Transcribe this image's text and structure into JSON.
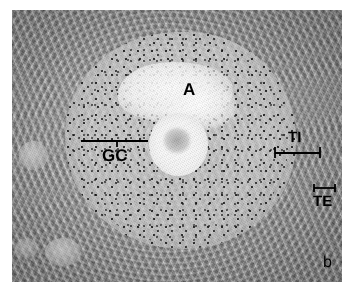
{
  "figure": {
    "panel_label": "b",
    "type": "histology-micrograph",
    "modality": "brightfield light microscopy",
    "palette": "grayscale"
  },
  "colors": {
    "background": "#ffffff",
    "annotation": "#000000",
    "tissue_mid": "#9a9a9a",
    "tissue_light": "#c8c8c8",
    "tissue_dark": "#6b6b6b",
    "antrum_bright": "#fbfbfb",
    "oocyte_bright": "#f6f6f6"
  },
  "annotations": [
    {
      "id": "antrum",
      "label": "A",
      "meaning": "antrum",
      "marker": "none",
      "x": 183,
      "y": 81
    },
    {
      "id": "granulosa-cells",
      "label": "GC",
      "meaning": "granulosa cells",
      "marker": "bar-with-center-tick",
      "x": 102,
      "y": 147,
      "bar": {
        "x": 81,
        "y": 136,
        "length": 67,
        "tick": "center-down"
      }
    },
    {
      "id": "theca-interna",
      "label": "TI",
      "meaning": "theca interna",
      "marker": "bar-with-end-ticks",
      "x": 288,
      "y": 130,
      "bar": {
        "x": 272,
        "y": 147,
        "length": 48,
        "tick": "ends-down"
      }
    },
    {
      "id": "theca-externa",
      "label": "TE",
      "meaning": "theca externa",
      "marker": "short-bracket",
      "x": 313,
      "y": 194,
      "bar": {
        "x": 312,
        "y": 184,
        "length": 22,
        "tick": "ends-down"
      }
    }
  ],
  "image_frame": {
    "left": 12,
    "top": 10,
    "width": 330,
    "height": 272
  }
}
